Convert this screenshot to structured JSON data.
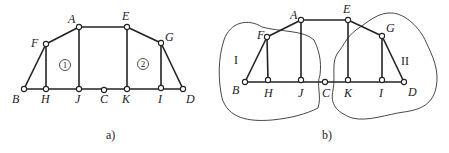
{
  "figure_a": {
    "caption": "a)",
    "nodes": {
      "A": {
        "x": 79,
        "y": 27,
        "label": "A",
        "lx": 68,
        "ly": 23
      },
      "E": {
        "x": 127,
        "y": 27,
        "label": "E",
        "lx": 122,
        "ly": 20
      },
      "F": {
        "x": 46,
        "y": 44,
        "label": "F",
        "lx": 31,
        "ly": 47
      },
      "G": {
        "x": 161,
        "y": 43,
        "label": "G",
        "lx": 165,
        "ly": 41
      },
      "B": {
        "x": 24,
        "y": 89,
        "label": "B",
        "lx": 12,
        "ly": 103
      },
      "H": {
        "x": 46,
        "y": 89,
        "label": "H",
        "lx": 41,
        "ly": 103
      },
      "J": {
        "x": 79,
        "y": 89,
        "label": "J",
        "lx": 75,
        "ly": 103
      },
      "C": {
        "x": 104,
        "y": 90,
        "label": "C",
        "lx": 100,
        "ly": 103
      },
      "K": {
        "x": 127,
        "y": 89,
        "label": "K",
        "lx": 122,
        "ly": 103
      },
      "I": {
        "x": 161,
        "y": 88,
        "label": "I",
        "lx": 158,
        "ly": 103
      },
      "D": {
        "x": 183,
        "y": 89,
        "label": "D",
        "lx": 186,
        "ly": 103
      }
    },
    "region_labels": [
      {
        "text": "1",
        "x": 65,
        "y": 68
      },
      {
        "text": "2",
        "x": 143,
        "y": 67
      }
    ]
  },
  "figure_b": {
    "caption": "b)",
    "nodes": {
      "A": {
        "x": 301,
        "y": 20,
        "label": "A",
        "lx": 290,
        "ly": 19
      },
      "E": {
        "x": 348,
        "y": 20,
        "label": "E",
        "lx": 343,
        "ly": 13
      },
      "F": {
        "x": 267,
        "y": 37,
        "label": "F",
        "lx": 257,
        "ly": 39
      },
      "G": {
        "x": 382,
        "y": 36,
        "label": "G",
        "lx": 386,
        "ly": 32
      },
      "B": {
        "x": 245,
        "y": 82,
        "label": "B",
        "lx": 232,
        "ly": 94
      },
      "H": {
        "x": 268,
        "y": 80,
        "label": "H",
        "lx": 264,
        "ly": 97
      },
      "J": {
        "x": 301,
        "y": 80,
        "label": "J",
        "lx": 298,
        "ly": 97
      },
      "C": {
        "x": 325,
        "y": 82,
        "label": "C",
        "lx": 322,
        "ly": 97
      },
      "K": {
        "x": 348,
        "y": 80,
        "label": "K",
        "lx": 344,
        "ly": 97
      },
      "I": {
        "x": 382,
        "y": 80,
        "label": "I",
        "lx": 379,
        "ly": 97
      },
      "D": {
        "x": 404,
        "y": 82,
        "label": "D",
        "lx": 408,
        "ly": 96
      }
    },
    "region_labels": [
      {
        "text": "I",
        "x": 236,
        "y": 64
      },
      {
        "text": "II",
        "x": 405,
        "y": 65
      }
    ]
  },
  "members": [
    [
      "B",
      "F"
    ],
    [
      "F",
      "A"
    ],
    [
      "A",
      "E"
    ],
    [
      "E",
      "G"
    ],
    [
      "G",
      "D"
    ],
    [
      "B",
      "D"
    ],
    [
      "F",
      "H"
    ],
    [
      "A",
      "J"
    ],
    [
      "E",
      "K"
    ],
    [
      "G",
      "I"
    ]
  ]
}
